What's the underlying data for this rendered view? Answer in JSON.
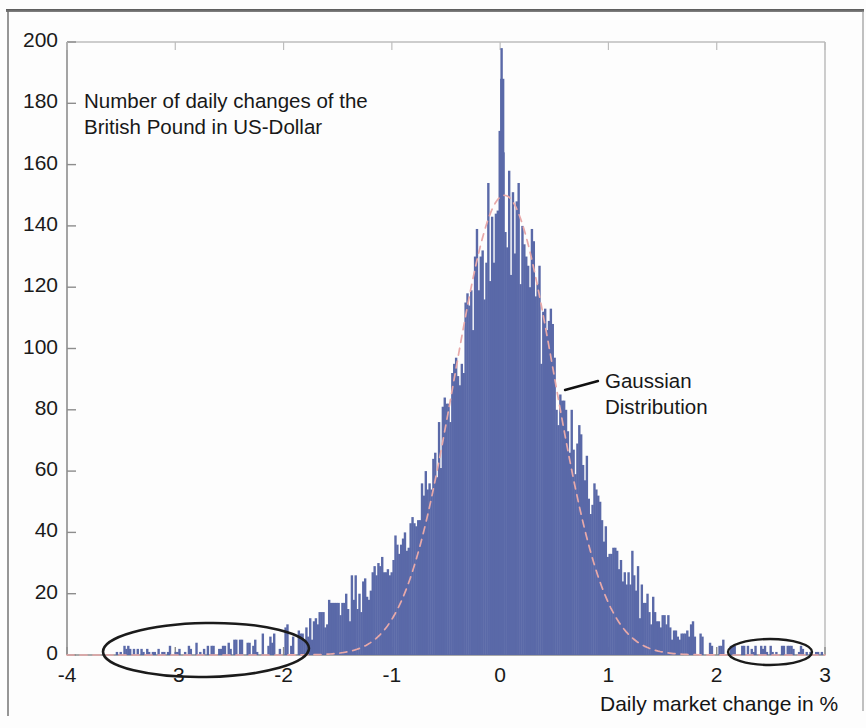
{
  "figure": {
    "annotation_title": "Number of daily changes of the\nBritish Pound in US-Dollar",
    "annotation_gaussian": "Gaussian\nDistribution",
    "axis_caption": "Daily market change in %",
    "bar_color": "#5a69a8",
    "curve_color": "#e8a9a9",
    "axis_color": "#8d8d8d",
    "text_color": "#181818",
    "ellipse_color": "#1b1b1b"
  },
  "chart_data": {
    "type": "bar",
    "title": "Number of daily changes of the British Pound in US-Dollar",
    "subtitle": "",
    "xlabel": "Daily market change in %",
    "ylabel": "",
    "xlim": [
      -4,
      3
    ],
    "ylim": [
      0,
      200
    ],
    "xticks": [
      -4,
      -3,
      -2,
      -1,
      0,
      1,
      2,
      3
    ],
    "xtick_labels": [
      "-4",
      "-3",
      "-2",
      "-1",
      "0",
      "1",
      "2",
      "3"
    ],
    "yticks": [
      0,
      20,
      40,
      60,
      80,
      100,
      120,
      140,
      160,
      180,
      200
    ],
    "ytick_labels": [
      "0",
      "20",
      "40",
      "60",
      "80",
      "100",
      "120",
      "140",
      "160",
      "180",
      "200"
    ],
    "grid": false,
    "legend": false,
    "bin_width": 0.0175,
    "annotations": [
      {
        "name": "title-note",
        "text": "Number of daily changes of the British Pound in US-Dollar",
        "x": -3.3,
        "y": 182
      },
      {
        "name": "gaussian-note",
        "text": "Gaussian Distribution",
        "x": 1.35,
        "y": 88,
        "leader_from": [
          0.86,
          86
        ]
      },
      {
        "name": "left-tail-ellipse",
        "shape": "ellipse",
        "cx": -2.72,
        "cy": 2,
        "rx": 0.88,
        "ry": 9
      },
      {
        "name": "right-tail-ellipse",
        "shape": "ellipse",
        "cx": 2.62,
        "cy": 2,
        "rx": 0.33,
        "ry": 4.5
      }
    ],
    "gaussian": {
      "amplitude": 150,
      "mean": 0.04,
      "sigma": 0.46,
      "style": "dashed"
    },
    "bins": [
      -3.52,
      -3.25,
      -3.12,
      -3.0,
      -2.93,
      -2.86,
      -2.79,
      -2.72,
      -2.65,
      -2.58,
      -2.51,
      -2.44,
      -2.37,
      -2.3,
      -2.23,
      -2.16,
      -2.09,
      -2.02,
      -1.95,
      -1.88,
      -1.81,
      -1.74,
      -1.67,
      -1.6,
      -1.53,
      -1.46,
      -1.39,
      -1.32,
      -1.25,
      -1.18,
      -1.11,
      -1.04,
      -0.97,
      -0.9,
      -0.83,
      -0.76,
      -0.69,
      -0.62,
      -0.55,
      -0.48,
      -0.41,
      -0.34,
      -0.27,
      -0.2,
      -0.13,
      -0.06,
      0.01,
      0.08,
      0.15,
      0.22,
      0.29,
      0.36,
      0.43,
      0.5,
      0.57,
      0.64,
      0.71,
      0.78,
      0.85,
      0.92,
      0.99,
      1.06,
      1.13,
      1.2,
      1.27,
      1.34,
      1.41,
      1.48,
      1.55,
      1.62,
      1.69,
      1.76,
      1.83,
      1.9,
      1.97,
      2.04,
      2.18,
      2.32,
      2.46,
      2.6,
      2.74,
      2.88
    ],
    "counts": [
      2,
      1,
      1,
      2,
      1,
      2,
      3,
      2,
      2,
      3,
      2,
      3,
      3,
      2,
      4,
      3,
      4,
      5,
      6,
      5,
      8,
      9,
      11,
      13,
      16,
      14,
      19,
      22,
      21,
      26,
      30,
      28,
      36,
      42,
      40,
      52,
      58,
      62,
      74,
      86,
      96,
      112,
      118,
      132,
      146,
      152,
      188,
      150,
      148,
      138,
      136,
      118,
      110,
      96,
      88,
      78,
      72,
      62,
      55,
      48,
      40,
      34,
      30,
      26,
      22,
      18,
      15,
      12,
      10,
      8,
      7,
      6,
      5,
      4,
      3,
      3,
      2,
      2,
      2,
      2,
      2,
      1
    ]
  }
}
